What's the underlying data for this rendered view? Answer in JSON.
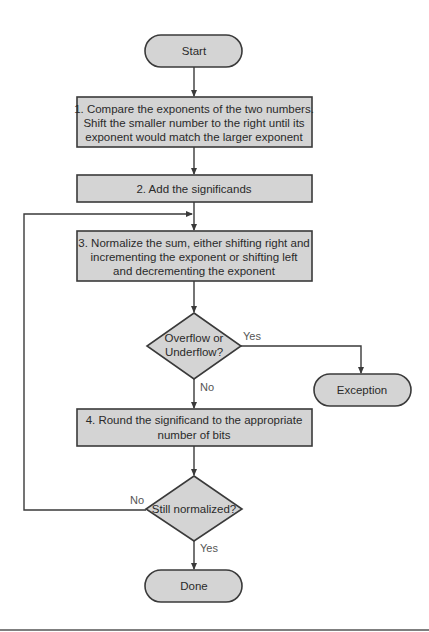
{
  "diagram": {
    "start": "Start",
    "step1": {
      "line1": "1. Compare the exponents of the two numbers.",
      "line2": "Shift the smaller number to the right until its",
      "line3": "exponent would match the larger exponent"
    },
    "step2": "2. Add the significands",
    "step3": {
      "line1": "3. Normalize the sum, either shifting right and",
      "line2": "incrementing the exponent or shifting left",
      "line3": "and decrementing the exponent"
    },
    "decision1": {
      "line1": "Overflow or",
      "line2": "Underflow?",
      "yes_label": "Yes",
      "no_label": "No"
    },
    "exception": "Exception",
    "step4": {
      "line1": "4. Round the significand to the appropriate",
      "line2": "number of bits"
    },
    "decision2": {
      "text": "Still normalized?",
      "yes_label": "Yes",
      "no_label": "No"
    },
    "done": "Done"
  },
  "colors": {
    "shape_fill": "#d4d4d4",
    "stroke": "#3a3a3a",
    "background": "#ffffff"
  }
}
